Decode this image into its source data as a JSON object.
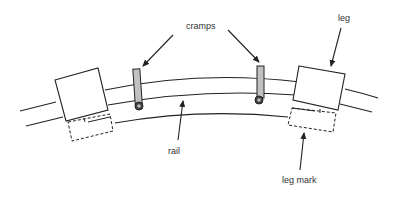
{
  "diagram": {
    "type": "technical-illustration",
    "labels": {
      "cramps": "cramps",
      "leg": "leg",
      "rail": "rail",
      "leg_mark": "leg mark"
    },
    "components": [
      "leg (left)",
      "leg (right)",
      "cramp (left)",
      "cramp (right)",
      "rail",
      "leg mark (left, dashed)",
      "leg mark (right, dashed)"
    ],
    "colors": {
      "line": "#222222",
      "cramp_fill": "#bbbbbb",
      "background": "#ffffff"
    }
  }
}
